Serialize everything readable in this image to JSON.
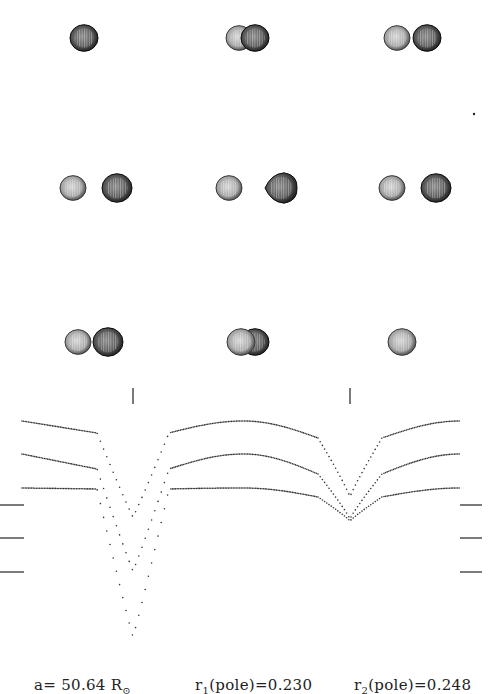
{
  "figure": {
    "star_images": [
      {
        "row": 0,
        "col": 0,
        "cx": 84,
        "cy": 38,
        "phase_desc": "primary eclipse (single disk)",
        "stars": [
          {
            "dx": 0,
            "r": 14,
            "shade": "dark"
          }
        ]
      },
      {
        "row": 0,
        "col": 1,
        "cx": 247,
        "cy": 38,
        "phase_desc": "near primary eclipse (overlap)",
        "stars": [
          {
            "dx": -8,
            "r": 13,
            "shade": "light"
          },
          {
            "dx": 8,
            "r": 14,
            "shade": "dark"
          }
        ]
      },
      {
        "row": 0,
        "col": 2,
        "cx": 412,
        "cy": 38,
        "phase_desc": "separated",
        "stars": [
          {
            "dx": -15,
            "r": 13,
            "shade": "light"
          },
          {
            "dx": 15,
            "r": 14,
            "shade": "dark"
          }
        ]
      },
      {
        "row": 1,
        "col": 0,
        "cx": 95,
        "cy": 188,
        "phase_desc": "quadrature",
        "stars": [
          {
            "dx": -22,
            "r": 13,
            "shade": "light"
          },
          {
            "dx": 22,
            "r": 15,
            "shade": "dark"
          }
        ]
      },
      {
        "row": 1,
        "col": 1,
        "cx": 255,
        "cy": 188,
        "phase_desc": "quadrature (tidal distortion)",
        "stars": [
          {
            "dx": -26,
            "r": 13,
            "shade": "light"
          },
          {
            "dx": 26,
            "r": 16,
            "shade": "dark",
            "ovoid": true
          }
        ]
      },
      {
        "row": 1,
        "col": 2,
        "cx": 414,
        "cy": 188,
        "phase_desc": "quadrature",
        "stars": [
          {
            "dx": -22,
            "r": 13,
            "shade": "light"
          },
          {
            "dx": 22,
            "r": 15,
            "shade": "dark"
          }
        ]
      },
      {
        "row": 2,
        "col": 0,
        "cx": 92,
        "cy": 342,
        "phase_desc": "separated",
        "stars": [
          {
            "dx": -14,
            "r": 13,
            "shade": "light"
          },
          {
            "dx": 16,
            "r": 15,
            "shade": "dark"
          }
        ]
      },
      {
        "row": 2,
        "col": 1,
        "cx": 247,
        "cy": 342,
        "phase_desc": "near secondary eclipse (overlap)",
        "stars": [
          {
            "dx": 8,
            "r": 14,
            "shade": "dark"
          },
          {
            "dx": -6,
            "r": 14,
            "shade": "light"
          }
        ]
      },
      {
        "row": 2,
        "col": 2,
        "cx": 402,
        "cy": 342,
        "phase_desc": "secondary eclipse (single disk)",
        "stars": [
          {
            "dx": 0,
            "r": 14,
            "shade": "light"
          }
        ]
      }
    ],
    "stray_dot": {
      "x": 474,
      "y": 114
    },
    "eclipse_markers": [
      {
        "x": 133,
        "y1": 388,
        "y2": 404
      },
      {
        "x": 350,
        "y1": 388,
        "y2": 404
      }
    ],
    "tick_marks": {
      "left": [
        {
          "x1": 0,
          "x2": 24,
          "y": 505
        },
        {
          "x1": 0,
          "x2": 24,
          "y": 538
        },
        {
          "x1": 0,
          "x2": 24,
          "y": 572
        }
      ],
      "right": [
        {
          "x1": 460,
          "x2": 482,
          "y": 505
        },
        {
          "x1": 460,
          "x2": 482,
          "y": 538
        },
        {
          "x1": 460,
          "x2": 482,
          "y": 572
        }
      ]
    },
    "caption": {
      "a_label": "a=",
      "a_value": "50.64",
      "a_unit": "R",
      "a_unit_sub": "⊙",
      "r1_label": "r",
      "r1_sub": "1",
      "r1_rest": "(pole)=0.230",
      "r2_label": "r",
      "r2_sub": "2",
      "r2_rest": "(pole)=0.248"
    },
    "colors": {
      "dark_star": "#2a2a2a",
      "light_star": "#9a9a9a",
      "dots": "#333333",
      "background": "#ffffff"
    }
  },
  "chart_data": {
    "type": "scatter",
    "xlabel": "Orbital phase",
    "ylabel": "Relative flux (offset)",
    "x_range_px": [
      22,
      460
    ],
    "primary_eclipse_px": 133,
    "secondary_eclipse_px": 350,
    "series": [
      {
        "name": "curve-1 (top)",
        "start_y_px": 421,
        "shoulder_left_y_px": 433,
        "primary_min_y_px": 517,
        "shoulder_right_y_px": 433,
        "pre_secondary_y_px": 438,
        "secondary_min_y_px": 497,
        "end_y_px": 421
      },
      {
        "name": "curve-2 (middle)",
        "start_y_px": 454,
        "shoulder_left_y_px": 469,
        "primary_min_y_px": 571,
        "shoulder_right_y_px": 469,
        "pre_secondary_y_px": 474,
        "secondary_min_y_px": 519,
        "end_y_px": 454
      },
      {
        "name": "curve-3 (bottom)",
        "start_y_px": 488,
        "shoulder_left_y_px": 489,
        "primary_min_y_px": 637,
        "shoulder_right_y_px": 489,
        "pre_secondary_y_px": 497,
        "secondary_min_y_px": 521,
        "end_y_px": 488
      }
    ],
    "annotations": [
      "a= 50.64 R⊙",
      "r1(pole)=0.230",
      "r2(pole)=0.248"
    ],
    "grid": false,
    "legend": null
  }
}
